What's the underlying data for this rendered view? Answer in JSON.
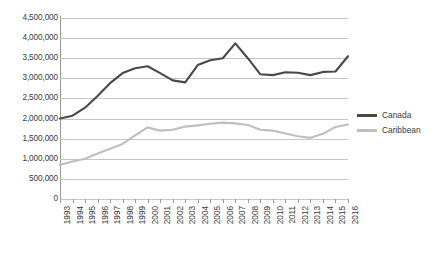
{
  "chart_data": {
    "type": "line",
    "title": "",
    "xlabel": "",
    "ylabel": "",
    "ylim": [
      0,
      4500000
    ],
    "ytick_step": 500000,
    "grid": true,
    "legend_position": "right",
    "categories": [
      "1993",
      "1994",
      "1995",
      "1996",
      "1997",
      "1998",
      "1999",
      "2000",
      "2001",
      "2002",
      "2003",
      "2004",
      "2005",
      "2006",
      "2007",
      "2008",
      "2009",
      "2010",
      "2011",
      "2012",
      "2013",
      "2014",
      "2015",
      "2016"
    ],
    "ytick_labels": [
      "4,500,000",
      "4,000,000",
      "3,500,000",
      "3,000,000",
      "2,500,000",
      "2,000,000",
      "1,500,000",
      "1,000,000",
      "500,000",
      "0"
    ],
    "ytick_values": [
      4500000,
      4000000,
      3500000,
      3000000,
      2500000,
      2000000,
      1500000,
      1000000,
      500000,
      0
    ],
    "series": [
      {
        "name": "Canada",
        "color": "#494949",
        "values": [
          2000000,
          2070000,
          2270000,
          2560000,
          2880000,
          3130000,
          3250000,
          3300000,
          3130000,
          2950000,
          2900000,
          3330000,
          3450000,
          3500000,
          3870000,
          3500000,
          3100000,
          3080000,
          3150000,
          3140000,
          3080000,
          3160000,
          3170000,
          3550000
        ]
      },
      {
        "name": "Caribbean",
        "color": "#bfbfbf",
        "values": [
          850000,
          930000,
          1000000,
          1130000,
          1250000,
          1370000,
          1580000,
          1780000,
          1700000,
          1720000,
          1800000,
          1830000,
          1870000,
          1900000,
          1880000,
          1840000,
          1720000,
          1700000,
          1630000,
          1560000,
          1520000,
          1620000,
          1790000,
          1850000
        ]
      }
    ]
  },
  "legend": {
    "items": [
      {
        "label": "Canada",
        "color": "#494949"
      },
      {
        "label": "Caribbean",
        "color": "#bfbfbf"
      }
    ]
  },
  "caption": {
    "text": ""
  }
}
